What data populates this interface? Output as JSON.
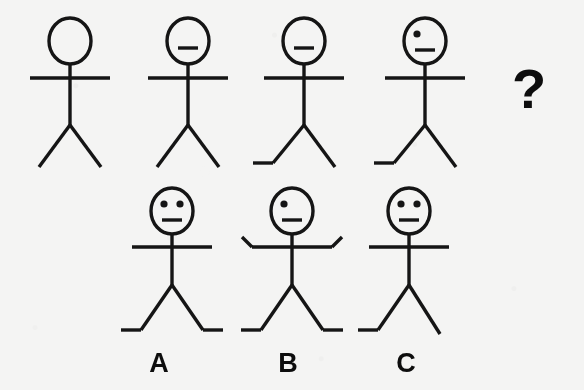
{
  "puzzle": {
    "type": "visual-sequence-analogy",
    "background_color": "#f4f4f3",
    "ink_color": "#151515",
    "question_mark": "?",
    "sequence_row": {
      "name": "sequence-row",
      "figures": [
        {
          "id": "figure-1",
          "position": 1,
          "head": "empty",
          "eyes": 0,
          "mouth": false,
          "arms": "straight-horizontal",
          "left_foot": false,
          "right_foot": false,
          "description": "stick figure with blank head, straight arms, no feet"
        },
        {
          "id": "figure-2",
          "position": 2,
          "head": "mouth-only",
          "eyes": 0,
          "mouth": true,
          "arms": "straight-horizontal",
          "left_foot": false,
          "right_foot": false,
          "description": "stick figure with mouth only, straight arms, no feet"
        },
        {
          "id": "figure-3",
          "position": 3,
          "head": "mouth-only",
          "eyes": 0,
          "mouth": true,
          "arms": "straight-horizontal",
          "left_foot": true,
          "right_foot": false,
          "description": "stick figure with mouth only, straight arms, left foot"
        },
        {
          "id": "figure-4",
          "position": 4,
          "head": "one-eye-and-mouth",
          "eyes": 1,
          "mouth": true,
          "arms": "straight-horizontal",
          "left_foot": true,
          "right_foot": false,
          "description": "stick figure with one eye and mouth, straight arms, left foot"
        }
      ],
      "missing_slot": {
        "id": "figure-5-unknown",
        "position": 5,
        "label": "?"
      }
    },
    "options_row": {
      "name": "options-row",
      "options": [
        {
          "id": "option-a",
          "label": "A",
          "eyes": 2,
          "mouth": true,
          "arms": "straight-horizontal",
          "left_foot": true,
          "right_foot": true,
          "description": "two eyes, mouth, straight arms, both feet"
        },
        {
          "id": "option-b",
          "label": "B",
          "eyes": 1,
          "mouth": true,
          "arms": "raised-bent-hands",
          "left_foot": true,
          "right_foot": true,
          "description": "one eye, mouth, arms with upturned hands, both feet"
        },
        {
          "id": "option-c",
          "label": "C",
          "eyes": 2,
          "mouth": true,
          "arms": "straight-horizontal",
          "left_foot": true,
          "right_foot": false,
          "description": "two eyes, mouth, straight arms, left foot only"
        }
      ]
    }
  }
}
